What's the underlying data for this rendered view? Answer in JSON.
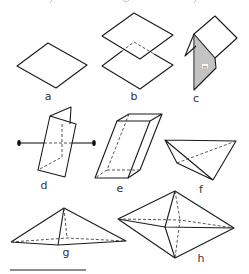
{
  "figure": {
    "panels": [
      {
        "id": "a",
        "label": "a",
        "shape": "single plane (rhombus)"
      },
      {
        "id": "b",
        "label": "b",
        "shape": "two parallel planes"
      },
      {
        "id": "c",
        "label": "c",
        "shape": "two intersecting planes, one hatched"
      },
      {
        "id": "d",
        "label": "d",
        "shape": "folded plane with axis"
      },
      {
        "id": "e",
        "label": "e",
        "shape": "parallelepiped"
      },
      {
        "id": "f",
        "label": "f",
        "shape": "tetrahedron"
      },
      {
        "id": "g",
        "label": "g",
        "shape": "flat pyramid"
      },
      {
        "id": "h",
        "label": "h",
        "shape": "bipyramid"
      }
    ],
    "c_panel_mark": "m",
    "colors": {
      "line": "#1a1a1a",
      "hidden": "#444444",
      "label": "#333333",
      "background": "#ffffff"
    }
  }
}
